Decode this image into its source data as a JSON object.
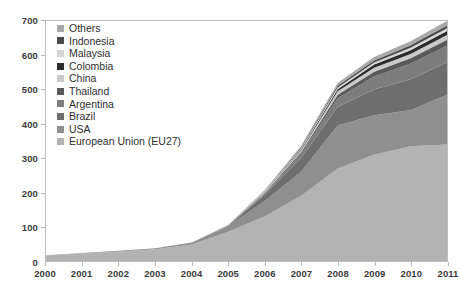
{
  "chart_data": {
    "type": "area",
    "stacked": true,
    "title": "",
    "subtitle": "",
    "xlabel": "",
    "ylabel": "",
    "grid": false,
    "legend_position": "top-left-inside",
    "x": [
      2000,
      2001,
      2002,
      2003,
      2004,
      2005,
      2006,
      2007,
      2008,
      2009,
      2010,
      2011
    ],
    "categories": [
      "2000",
      "2001",
      "2002",
      "2003",
      "2004",
      "2005",
      "2006",
      "2007",
      "2008",
      "2009",
      "2010",
      "2011"
    ],
    "xlim": [
      2000,
      2011
    ],
    "ylim": [
      0,
      700
    ],
    "y_ticks": [
      0,
      100,
      200,
      300,
      400,
      500,
      600,
      700
    ],
    "x_ticks": [
      "2000",
      "2001",
      "2002",
      "2003",
      "2004",
      "2005",
      "2006",
      "2007",
      "2008",
      "2009",
      "2010",
      "2011"
    ],
    "series": [
      {
        "name": "European Union (EU27)",
        "color": "#b3b3b3",
        "values": [
          16,
          22,
          28,
          34,
          48,
          85,
          130,
          190,
          270,
          310,
          335,
          340
        ]
      },
      {
        "name": "USA",
        "color": "#8f8f8f",
        "values": [
          1,
          1,
          2,
          3,
          5,
          16,
          45,
          70,
          125,
          115,
          105,
          145
        ]
      },
      {
        "name": "Brazil",
        "color": "#6e6e6e",
        "values": [
          0,
          0,
          0,
          0,
          1,
          2,
          18,
          40,
          55,
          75,
          90,
          95
        ]
      },
      {
        "name": "Argentina",
        "color": "#7d7d7d",
        "values": [
          0,
          0,
          0,
          0,
          0,
          1,
          4,
          12,
          25,
          38,
          45,
          48
        ]
      },
      {
        "name": "Thailand",
        "color": "#5a5a5a",
        "values": [
          0,
          0,
          0,
          0,
          0,
          0,
          2,
          5,
          10,
          14,
          16,
          17
        ]
      },
      {
        "name": "China",
        "color": "#c9c9c9",
        "values": [
          0,
          0,
          0,
          0,
          0,
          1,
          3,
          6,
          10,
          12,
          13,
          14
        ]
      },
      {
        "name": "Colombia",
        "color": "#2b2b2b",
        "values": [
          0,
          0,
          0,
          0,
          0,
          0,
          1,
          3,
          6,
          9,
          11,
          12
        ]
      },
      {
        "name": "Malaysia",
        "color": "#d6d6d6",
        "values": [
          0,
          0,
          0,
          0,
          0,
          0,
          1,
          3,
          5,
          6,
          7,
          8
        ]
      },
      {
        "name": "Indonesia",
        "color": "#4a4a4a",
        "values": [
          0,
          0,
          0,
          0,
          0,
          0,
          1,
          3,
          5,
          6,
          7,
          8
        ]
      },
      {
        "name": "Others",
        "color": "#a8a8a8",
        "values": [
          0,
          0,
          0,
          0,
          0,
          1,
          2,
          4,
          8,
          10,
          12,
          13
        ]
      }
    ],
    "totals": [
      17,
      23,
      30,
      37,
      54,
      106,
      207,
      336,
      519,
      595,
      641,
      700
    ]
  },
  "legend": {
    "items": [
      {
        "label": "Others",
        "color": "#a8a8a8"
      },
      {
        "label": "Indonesia",
        "color": "#4a4a4a"
      },
      {
        "label": "Malaysia",
        "color": "#d6d6d6"
      },
      {
        "label": "Colombia",
        "color": "#2b2b2b"
      },
      {
        "label": "China",
        "color": "#c9c9c9"
      },
      {
        "label": "Thailand",
        "color": "#5a5a5a"
      },
      {
        "label": "Argentina",
        "color": "#7d7d7d"
      },
      {
        "label": "Brazil",
        "color": "#6e6e6e"
      },
      {
        "label": "USA",
        "color": "#8f8f8f"
      },
      {
        "label": "European Union (EU27)",
        "color": "#b3b3b3"
      }
    ]
  },
  "axes": {
    "y_tick_labels": [
      "700",
      "600",
      "500",
      "400",
      "300",
      "200",
      "100",
      "0"
    ],
    "x_tick_labels": [
      "2000",
      "2001",
      "2002",
      "2003",
      "2004",
      "2005",
      "2006",
      "2007",
      "2008",
      "2009",
      "2010",
      "2011"
    ]
  }
}
